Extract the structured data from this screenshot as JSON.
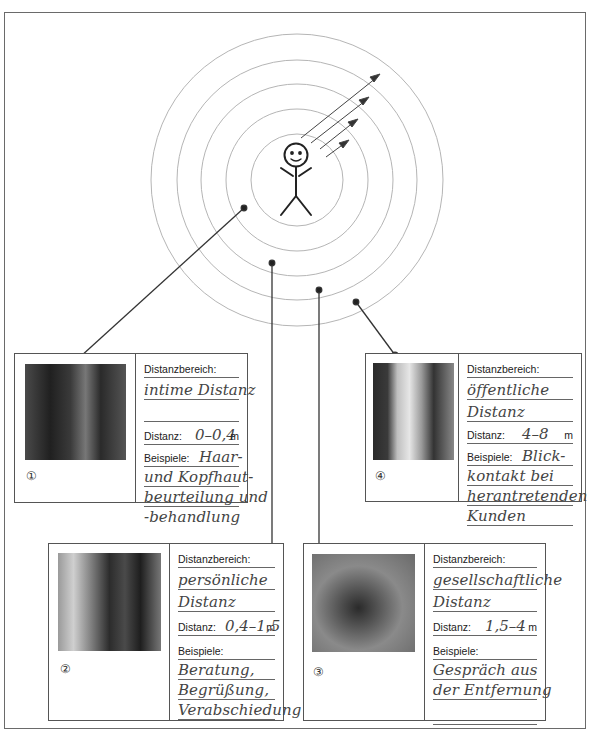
{
  "diagram": {
    "center_figure": "stick-figure-person",
    "rings": 5,
    "arrows": 4
  },
  "cards": [
    {
      "number": "①",
      "photo": "hairdresser-scalp-treatment-photo",
      "distanzbereich_label": "Distanzbereich:",
      "bereich_lines": [
        "intime Distanz",
        ""
      ],
      "distanz_label": "Distanz:",
      "distanz_value": "0–0,4",
      "unit": "m",
      "beispiele_label": "Beispiele:",
      "beispiele_lines": [
        "Haar-",
        "und Kopfhaut-",
        "beurteilung und",
        "-behandlung"
      ]
    },
    {
      "number": "②",
      "photo": "hairdresser-consultation-photo",
      "distanzbereich_label": "Distanzbereich:",
      "bereich_lines": [
        "persönliche",
        "Distanz"
      ],
      "distanz_label": "Distanz:",
      "distanz_value": "0,4–1,5",
      "unit": "m",
      "beispiele_label": "Beispiele:",
      "beispiele_lines": [
        "Beratung,",
        "Begrüßung,",
        "Verabschiedung"
      ]
    },
    {
      "number": "③",
      "photo": "people-in-lawn-chairs-photo",
      "distanzbereich_label": "Distanzbereich:",
      "bereich_lines": [
        "gesellschaftliche",
        "Distanz"
      ],
      "distanz_label": "Distanz:",
      "distanz_value": "1,5–4",
      "unit": "m",
      "beispiele_label": "Beispiele:",
      "beispiele_lines": [
        "Gespräch aus",
        "der Entfernung",
        ""
      ]
    },
    {
      "number": "④",
      "photo": "salon-greeting-from-afar-photo",
      "distanzbereich_label": "Distanzbereich:",
      "bereich_lines": [
        "öffentliche",
        "Distanz"
      ],
      "distanz_label": "Distanz:",
      "distanz_value": "4–8",
      "unit": "m",
      "beispiele_label": "Beispiele:",
      "beispiele_lines": [
        "Blick-",
        "kontakt bei",
        "herantretenden",
        "Kunden"
      ]
    }
  ]
}
